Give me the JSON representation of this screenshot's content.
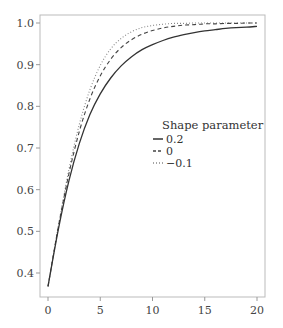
{
  "chart_data": {
    "type": "line",
    "title": "",
    "xlabel": "",
    "ylabel": "",
    "xlim": [
      0,
      20
    ],
    "ylim": [
      0.34,
      1.02
    ],
    "grid": false,
    "legend_position": "center-right (inside plot)",
    "legend_title": "Shape parameter",
    "x_ticks": [
      0,
      5,
      10,
      15,
      20
    ],
    "x_tick_labels": [
      "0",
      "5",
      "10",
      "15",
      "20"
    ],
    "y_ticks": [
      0.4,
      0.5,
      0.6,
      0.7,
      0.8,
      0.9,
      1.0
    ],
    "y_tick_labels": [
      "0.4",
      "0.5",
      "0.6",
      "0.7",
      "0.8",
      "0.9",
      "1.0"
    ],
    "x": [
      0,
      1,
      2,
      3,
      4,
      5,
      6,
      7,
      8,
      9,
      10,
      11,
      12,
      13,
      14,
      15,
      16,
      17,
      18,
      19,
      20
    ],
    "series": [
      {
        "name": "0.2",
        "style": "solid",
        "color": "#333333",
        "values": [
          0.368,
          0.506,
          0.621,
          0.711,
          0.78,
          0.83,
          0.868,
          0.897,
          0.919,
          0.936,
          0.948,
          0.958,
          0.966,
          0.972,
          0.977,
          0.981,
          0.984,
          0.987,
          0.989,
          0.99,
          0.992
        ]
      },
      {
        "name": "0",
        "style": "dashed",
        "color": "#444444",
        "values": [
          0.368,
          0.512,
          0.638,
          0.74,
          0.817,
          0.873,
          0.913,
          0.941,
          0.96,
          0.973,
          0.982,
          0.988,
          0.992,
          0.995,
          0.996,
          0.998,
          0.998,
          0.999,
          0.999,
          1.0,
          1.0
        ]
      },
      {
        "name": "−0.1",
        "style": "dotted",
        "color": "#888888",
        "values": [
          0.368,
          0.514,
          0.648,
          0.757,
          0.839,
          0.898,
          0.938,
          0.963,
          0.979,
          0.989,
          0.994,
          0.997,
          0.999,
          0.999,
          1.0,
          1.0,
          1.0,
          1.0,
          1.0,
          1.0,
          1.0
        ]
      }
    ]
  }
}
